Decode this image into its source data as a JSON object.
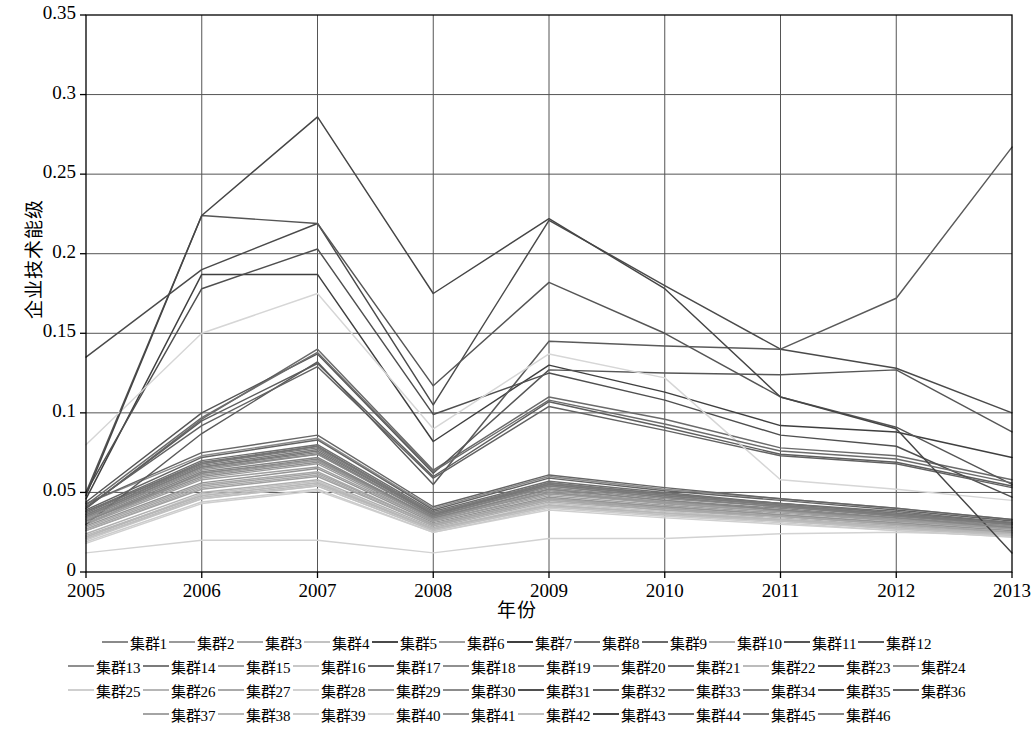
{
  "chart_data": {
    "type": "line",
    "title": "",
    "xlabel": "年份",
    "ylabel": "企业技术能级",
    "x": [
      2005,
      2006,
      2007,
      2008,
      2009,
      2010,
      2011,
      2012,
      2013
    ],
    "xtick_labels": [
      "2005",
      "2006",
      "2007",
      "2008",
      "2009",
      "2010",
      "2011",
      "2012",
      "2013"
    ],
    "ytick_labels": [
      "0",
      "0.05",
      "0.1",
      "0.15",
      "0.2",
      "0.25",
      "0.3",
      "0.35"
    ],
    "ytick_values": [
      0,
      0.05,
      0.1,
      0.15,
      0.2,
      0.25,
      0.3,
      0.35
    ],
    "ylim": [
      0,
      0.35
    ],
    "xlim": [
      2005,
      2013
    ],
    "grid": true,
    "legend_position": "bottom",
    "legend_columns": 12,
    "series": [
      {
        "name": "集群1",
        "color": "#8a8a8a",
        "values": [
          0.043,
          0.073,
          0.084,
          0.04,
          0.06,
          0.052,
          0.046,
          0.04,
          0.033
        ]
      },
      {
        "name": "集群2",
        "color": "#9a9a9a",
        "values": [
          0.03,
          0.062,
          0.07,
          0.034,
          0.05,
          0.044,
          0.039,
          0.034,
          0.028
        ]
      },
      {
        "name": "集群3",
        "color": "#a8a8a8",
        "values": [
          0.028,
          0.055,
          0.063,
          0.03,
          0.046,
          0.041,
          0.036,
          0.031,
          0.026
        ]
      },
      {
        "name": "集群4",
        "color": "#c2c2c2",
        "values": [
          0.022,
          0.049,
          0.057,
          0.027,
          0.043,
          0.038,
          0.033,
          0.029,
          0.024
        ]
      },
      {
        "name": "集群5",
        "color": "#4a4a4a",
        "values": [
          0.135,
          0.19,
          0.219,
          0.105,
          0.221,
          0.18,
          0.14,
          0.128,
          0.1
        ]
      },
      {
        "name": "集群6",
        "color": "#a0a0a0",
        "values": [
          0.026,
          0.052,
          0.06,
          0.029,
          0.045,
          0.04,
          0.035,
          0.03,
          0.025
        ]
      },
      {
        "name": "集群7",
        "color": "#3f3f3f",
        "values": [
          0.046,
          0.187,
          0.187,
          0.082,
          0.13,
          0.113,
          0.092,
          0.088,
          0.072
        ]
      },
      {
        "name": "集群8",
        "color": "#707070",
        "values": [
          0.038,
          0.068,
          0.079,
          0.036,
          0.056,
          0.049,
          0.043,
          0.037,
          0.031
        ]
      },
      {
        "name": "集群9",
        "color": "#6a6a6a",
        "values": [
          0.04,
          0.096,
          0.14,
          0.064,
          0.11,
          0.096,
          0.078,
          0.073,
          0.058
        ]
      },
      {
        "name": "集群10",
        "color": "#b0b0b0",
        "values": [
          0.024,
          0.05,
          0.058,
          0.028,
          0.044,
          0.039,
          0.034,
          0.029,
          0.024
        ]
      },
      {
        "name": "集群11",
        "color": "#555555",
        "values": [
          0.05,
          0.224,
          0.219,
          0.117,
          0.182,
          0.15,
          0.11,
          0.091,
          0.055
        ]
      },
      {
        "name": "集群12",
        "color": "#5e5e5e",
        "values": [
          0.04,
          0.095,
          0.131,
          0.06,
          0.107,
          0.091,
          0.074,
          0.069,
          0.054
        ]
      },
      {
        "name": "集群13",
        "color": "#8f8f8f",
        "values": [
          0.034,
          0.064,
          0.074,
          0.035,
          0.054,
          0.047,
          0.041,
          0.036,
          0.03
        ]
      },
      {
        "name": "集群14",
        "color": "#7b7b7b",
        "values": [
          0.036,
          0.067,
          0.077,
          0.036,
          0.055,
          0.048,
          0.042,
          0.036,
          0.03
        ]
      },
      {
        "name": "集群15",
        "color": "#9e9e9e",
        "values": [
          0.03,
          0.058,
          0.066,
          0.032,
          0.048,
          0.042,
          0.037,
          0.032,
          0.027
        ]
      },
      {
        "name": "集群16",
        "color": "#c8c8c8",
        "values": [
          0.02,
          0.046,
          0.054,
          0.026,
          0.041,
          0.036,
          0.032,
          0.027,
          0.023
        ]
      },
      {
        "name": "集群17",
        "color": "#666666",
        "values": [
          0.043,
          0.075,
          0.086,
          0.041,
          0.061,
          0.053,
          0.046,
          0.04,
          0.033
        ]
      },
      {
        "name": "集群18",
        "color": "#909090",
        "values": [
          0.032,
          0.06,
          0.069,
          0.033,
          0.05,
          0.043,
          0.038,
          0.033,
          0.028
        ]
      },
      {
        "name": "集群19",
        "color": "#787878",
        "values": [
          0.035,
          0.066,
          0.076,
          0.036,
          0.055,
          0.048,
          0.042,
          0.036,
          0.03
        ]
      },
      {
        "name": "集群20",
        "color": "#858585",
        "values": [
          0.033,
          0.063,
          0.072,
          0.034,
          0.052,
          0.045,
          0.04,
          0.034,
          0.029
        ]
      },
      {
        "name": "集群21",
        "color": "#6f6f6f",
        "values": [
          0.038,
          0.07,
          0.08,
          0.038,
          0.057,
          0.05,
          0.043,
          0.038,
          0.031
        ]
      },
      {
        "name": "集群22",
        "color": "#bcbcbc",
        "values": [
          0.021,
          0.047,
          0.055,
          0.027,
          0.042,
          0.037,
          0.032,
          0.028,
          0.023
        ]
      },
      {
        "name": "集群23",
        "color": "#5a5a5a",
        "values": [
          0.03,
          0.087,
          0.132,
          0.055,
          0.145,
          0.142,
          0.14,
          0.172,
          0.267
        ]
      },
      {
        "name": "集群24",
        "color": "#949494",
        "values": [
          0.029,
          0.056,
          0.065,
          0.031,
          0.047,
          0.041,
          0.036,
          0.031,
          0.026
        ]
      },
      {
        "name": "集群25",
        "color": "#cfcfcf",
        "values": [
          0.018,
          0.043,
          0.051,
          0.025,
          0.039,
          0.034,
          0.03,
          0.026,
          0.022
        ]
      },
      {
        "name": "集群26",
        "color": "#b6b6b6",
        "values": [
          0.023,
          0.048,
          0.056,
          0.027,
          0.042,
          0.037,
          0.033,
          0.028,
          0.024
        ]
      },
      {
        "name": "集群27",
        "color": "#aaaaaa",
        "values": [
          0.026,
          0.053,
          0.061,
          0.029,
          0.045,
          0.039,
          0.035,
          0.03,
          0.025
        ]
      },
      {
        "name": "集群28",
        "color": "#d2d2d2",
        "values": [
          0.012,
          0.02,
          0.02,
          0.012,
          0.021,
          0.021,
          0.024,
          0.025,
          0.023
        ]
      },
      {
        "name": "集群29",
        "color": "#9c9c9c",
        "values": [
          0.031,
          0.059,
          0.068,
          0.032,
          0.049,
          0.043,
          0.038,
          0.032,
          0.027
        ]
      },
      {
        "name": "集群30",
        "color": "#8c8c8c",
        "values": [
          0.034,
          0.065,
          0.074,
          0.035,
          0.053,
          0.046,
          0.041,
          0.035,
          0.029
        ]
      },
      {
        "name": "集群31",
        "color": "#4f4f4f",
        "values": [
          0.05,
          0.178,
          0.203,
          0.099,
          0.125,
          0.108,
          0.086,
          0.079,
          0.047
        ]
      },
      {
        "name": "集群32",
        "color": "#626262",
        "values": [
          0.041,
          0.092,
          0.129,
          0.059,
          0.104,
          0.089,
          0.073,
          0.068,
          0.053
        ]
      },
      {
        "name": "集群33",
        "color": "#747474",
        "values": [
          0.037,
          0.069,
          0.079,
          0.037,
          0.056,
          0.049,
          0.043,
          0.037,
          0.031
        ]
      },
      {
        "name": "集群34",
        "color": "#7f7f7f",
        "values": [
          0.035,
          0.066,
          0.075,
          0.035,
          0.054,
          0.047,
          0.041,
          0.035,
          0.03
        ]
      },
      {
        "name": "集群35",
        "color": "#565656",
        "values": [
          0.044,
          0.1,
          0.137,
          0.062,
          0.127,
          0.125,
          0.124,
          0.127,
          0.088
        ]
      },
      {
        "name": "集群36",
        "color": "#646464",
        "values": [
          0.039,
          0.072,
          0.083,
          0.039,
          0.059,
          0.051,
          0.045,
          0.039,
          0.032
        ]
      },
      {
        "name": "集群37",
        "color": "#a4a4a4",
        "values": [
          0.027,
          0.054,
          0.062,
          0.03,
          0.046,
          0.04,
          0.035,
          0.03,
          0.025
        ]
      },
      {
        "name": "集群38",
        "color": "#b8b8b8",
        "values": [
          0.022,
          0.048,
          0.056,
          0.027,
          0.042,
          0.037,
          0.033,
          0.028,
          0.024
        ]
      },
      {
        "name": "集群39",
        "color": "#cccccc",
        "values": [
          0.019,
          0.044,
          0.052,
          0.025,
          0.04,
          0.035,
          0.031,
          0.026,
          0.022
        ]
      },
      {
        "name": "集群40",
        "color": "#d6d6d6",
        "values": [
          0.08,
          0.15,
          0.175,
          0.09,
          0.137,
          0.122,
          0.058,
          0.052,
          0.045
        ]
      },
      {
        "name": "集群41",
        "color": "#989898",
        "values": [
          0.033,
          0.061,
          0.07,
          0.033,
          0.051,
          0.044,
          0.039,
          0.033,
          0.028
        ]
      },
      {
        "name": "集群42",
        "color": "#c0c0c0",
        "values": [
          0.021,
          0.046,
          0.054,
          0.026,
          0.041,
          0.036,
          0.032,
          0.027,
          0.023
        ]
      },
      {
        "name": "集群43",
        "color": "#454545",
        "values": [
          0.048,
          0.224,
          0.286,
          0.175,
          0.222,
          0.178,
          0.11,
          0.09,
          0.012
        ]
      },
      {
        "name": "集群44",
        "color": "#6c6c6c",
        "values": [
          0.042,
          0.097,
          0.138,
          0.063,
          0.108,
          0.093,
          0.076,
          0.071,
          0.056
        ]
      },
      {
        "name": "集群45",
        "color": "#7a7a7a",
        "values": [
          0.036,
          0.068,
          0.078,
          0.037,
          0.056,
          0.048,
          0.042,
          0.036,
          0.03
        ]
      },
      {
        "name": "集群46",
        "color": "#868686",
        "values": [
          0.032,
          0.062,
          0.071,
          0.034,
          0.052,
          0.045,
          0.039,
          0.034,
          0.028
        ]
      }
    ]
  },
  "legend_rows": [
    [
      "集群1",
      "集群2",
      "集群3",
      "集群4",
      "集群5",
      "集群6",
      "集群7",
      "集群8",
      "集群9",
      "集群10",
      "集群11",
      "集群12"
    ],
    [
      "集群13",
      "集群14",
      "集群15",
      "集群16",
      "集群17",
      "集群18",
      "集群19",
      "集群20",
      "集群21",
      "集群22",
      "集群23",
      "集群24"
    ],
    [
      "集群25",
      "集群26",
      "集群27",
      "集群28",
      "集群29",
      "集群30",
      "集群31",
      "集群32",
      "集群33",
      "集群34",
      "集群35",
      "集群36"
    ],
    [
      "集群37",
      "集群38",
      "集群39",
      "集群40",
      "集群41",
      "集群42",
      "集群43",
      "集群44",
      "集群45",
      "集群46"
    ]
  ],
  "style": {
    "axis_color": "#000000",
    "grid_color": "#555555",
    "background": "#ffffff"
  }
}
